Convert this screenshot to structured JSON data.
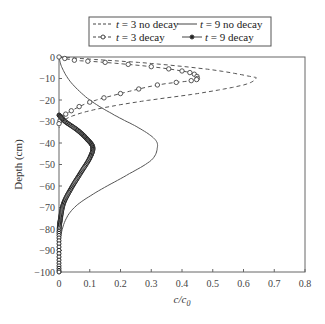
{
  "chart_data": {
    "type": "line",
    "title": "",
    "xlabel": "c/c0",
    "ylabel": "Depth (cm)",
    "xlim": [
      0,
      0.8
    ],
    "ylim": [
      -100,
      0
    ],
    "xticks": [
      "0",
      "0.1",
      "0.2",
      "0.3",
      "0.4",
      "0.5",
      "0.6",
      "0.7",
      "0.8"
    ],
    "yticks": [
      "0",
      "-10",
      "-20",
      "-30",
      "-40",
      "-50",
      "-60",
      "-70",
      "-80",
      "-90",
      "-100"
    ],
    "grid": false,
    "legend_position": "top",
    "legend": [
      {
        "label": "t = 3 no decay",
        "style": "dashed"
      },
      {
        "label": "t = 9 no decay",
        "style": "solid"
      },
      {
        "label": "t = 3 decay",
        "style": "dashed-open-circle"
      },
      {
        "label": "t = 9 decay",
        "style": "solid-filled-circle"
      }
    ],
    "series": [
      {
        "name": "t = 3 no decay",
        "points": [
          [
            0.0,
            0
          ],
          [
            0.1,
            -1
          ],
          [
            0.3,
            -3
          ],
          [
            0.5,
            -6
          ],
          [
            0.62,
            -9
          ],
          [
            0.64,
            -10
          ],
          [
            0.6,
            -13
          ],
          [
            0.45,
            -17
          ],
          [
            0.25,
            -21
          ],
          [
            0.1,
            -25
          ],
          [
            0.02,
            -29
          ],
          [
            0.0,
            -33
          ]
        ]
      },
      {
        "name": "t = 9 no decay",
        "points": [
          [
            0.0,
            0
          ],
          [
            0.01,
            -5
          ],
          [
            0.04,
            -12
          ],
          [
            0.1,
            -20
          ],
          [
            0.18,
            -27
          ],
          [
            0.26,
            -33
          ],
          [
            0.31,
            -38
          ],
          [
            0.32,
            -42
          ],
          [
            0.3,
            -48
          ],
          [
            0.22,
            -55
          ],
          [
            0.12,
            -63
          ],
          [
            0.05,
            -70
          ],
          [
            0.015,
            -78
          ],
          [
            0.0,
            -90
          ],
          [
            0.0,
            -100
          ]
        ]
      },
      {
        "name": "t = 3 decay",
        "points": [
          [
            0.0,
            0
          ],
          [
            0.05,
            -1.5
          ],
          [
            0.15,
            -2.5
          ],
          [
            0.3,
            -4.5
          ],
          [
            0.4,
            -6.5
          ],
          [
            0.44,
            -8
          ],
          [
            0.45,
            -10
          ],
          [
            0.43,
            -11
          ],
          [
            0.32,
            -13
          ],
          [
            0.2,
            -17
          ],
          [
            0.1,
            -21
          ],
          [
            0.04,
            -25
          ],
          [
            0.01,
            -28
          ],
          [
            0.0,
            -31
          ]
        ]
      },
      {
        "name": "t = 9 decay",
        "points": [
          [
            0.0,
            -27
          ],
          [
            0.02,
            -30
          ],
          [
            0.06,
            -34
          ],
          [
            0.09,
            -38
          ],
          [
            0.11,
            -42
          ],
          [
            0.1,
            -47
          ],
          [
            0.07,
            -54
          ],
          [
            0.04,
            -61
          ],
          [
            0.015,
            -68
          ],
          [
            0.005,
            -75
          ],
          [
            0.0,
            -82
          ],
          [
            0.0,
            -100
          ]
        ]
      }
    ]
  }
}
